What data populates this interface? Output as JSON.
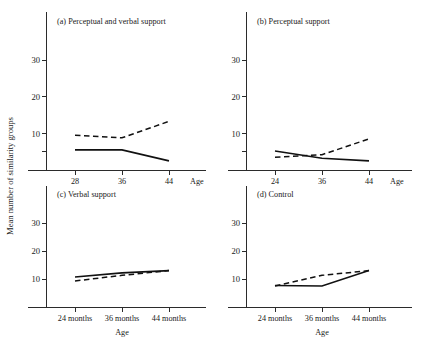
{
  "figure": {
    "ylabel": "Mean number of similarity groups",
    "xlabel": "Age",
    "yticks": [
      "10",
      "20",
      "30"
    ],
    "accent_color": "#111111"
  },
  "chart_data": [
    {
      "type": "line",
      "title": "(a) Perceptual and verbal support",
      "xlabel": "Age",
      "ylabel": "Mean number of similarity groups",
      "categories": [
        "28",
        "36",
        "44"
      ],
      "x": [
        28,
        36,
        44
      ],
      "ylim": [
        0,
        35
      ],
      "yticks": [
        10,
        20,
        30
      ],
      "grid": false,
      "legend": "none",
      "series": [
        {
          "name": "dashed",
          "style": "dashed",
          "values": [
            9.5,
            8.8,
            13.3
          ]
        },
        {
          "name": "solid",
          "style": "solid",
          "values": [
            5.5,
            5.5,
            2.5
          ]
        }
      ]
    },
    {
      "type": "line",
      "title": "(b) Perceptual support",
      "xlabel": "Age",
      "ylabel": "Mean number of similarity groups",
      "categories": [
        "24",
        "36",
        "44"
      ],
      "x": [
        24,
        36,
        44
      ],
      "ylim": [
        0,
        35
      ],
      "yticks": [
        10,
        20,
        30
      ],
      "grid": false,
      "legend": "none",
      "series": [
        {
          "name": "dashed",
          "style": "dashed",
          "values": [
            3.5,
            4.2,
            8.5
          ]
        },
        {
          "name": "solid",
          "style": "solid",
          "values": [
            5.2,
            3.2,
            2.5
          ]
        }
      ]
    },
    {
      "type": "line",
      "title": "(c) Verbal support",
      "xlabel": "Age",
      "ylabel": "Mean number of similarity groups",
      "categories": [
        "24 months",
        "36 months",
        "44 months"
      ],
      "x": [
        24,
        36,
        44
      ],
      "ylim": [
        0,
        35
      ],
      "yticks": [
        10,
        20,
        30
      ],
      "grid": false,
      "legend": "none",
      "series": [
        {
          "name": "solid",
          "style": "solid",
          "values": [
            10.7,
            12.2,
            13.0
          ]
        },
        {
          "name": "dashed",
          "style": "dashed",
          "values": [
            9.3,
            11.3,
            13.0
          ]
        }
      ]
    },
    {
      "type": "line",
      "title": "(d) Control",
      "xlabel": "Age",
      "ylabel": "Mean number of similarity groups",
      "categories": [
        "24 months",
        "36 months",
        "44 months"
      ],
      "x": [
        24,
        36,
        44
      ],
      "ylim": [
        0,
        35
      ],
      "yticks": [
        10,
        20,
        30
      ],
      "grid": false,
      "legend": "none",
      "series": [
        {
          "name": "solid",
          "style": "solid",
          "values": [
            7.7,
            7.5,
            13.0
          ]
        },
        {
          "name": "dashed",
          "style": "dashed",
          "values": [
            7.5,
            11.3,
            13.0
          ]
        }
      ]
    }
  ],
  "panels": {
    "a": {
      "title": "(a) Perceptual and verbal support",
      "xticks": [
        "28",
        "36",
        "44"
      ],
      "yticks": [
        "10",
        "20",
        "30"
      ],
      "axis_name": "Age"
    },
    "b": {
      "title": "(b) Perceptual support",
      "xticks": [
        "24",
        "36",
        "44"
      ],
      "yticks": [
        "10",
        "20",
        "30"
      ],
      "axis_name": "Age"
    },
    "c": {
      "title": "(c) Verbal support",
      "xticks": [
        "24 months",
        "36 months",
        "44 months"
      ],
      "yticks": [
        "10",
        "20",
        "30"
      ],
      "axis_name": "Age"
    },
    "d": {
      "title": "(d) Control",
      "xticks": [
        "24 months",
        "36 months",
        "44 months"
      ],
      "yticks": [
        "10",
        "20",
        "30"
      ],
      "axis_name": "Age"
    }
  }
}
